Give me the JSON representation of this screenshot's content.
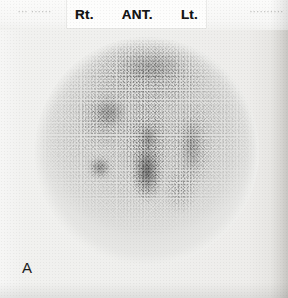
{
  "figure": {
    "panel_letter": "A",
    "modality": "planar-scintigraphy",
    "view": "anterior"
  },
  "header": {
    "left_faded_text": "···  ······",
    "right_faded_text": "··········",
    "marker_right": "Rt.",
    "marker_view": "ANT.",
    "marker_left": "Lt."
  },
  "image_region": {
    "field_of_view_shape": "circle",
    "background_color": "#f1f1ef",
    "count_color": "#1e1e1e"
  }
}
